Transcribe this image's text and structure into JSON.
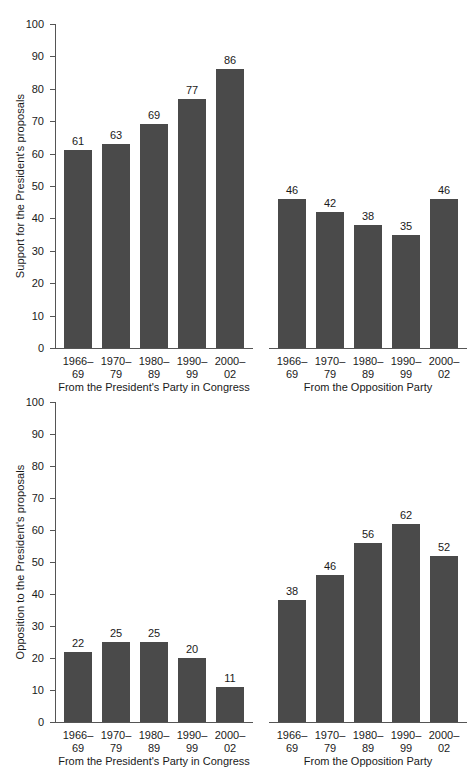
{
  "chart_data": [
    {
      "type": "bar",
      "title": "",
      "xlabel": "",
      "ylabel": "Support for the President's proposals",
      "ylim": [
        0,
        100
      ],
      "yticks": [
        0,
        10,
        20,
        30,
        40,
        50,
        60,
        70,
        80,
        90,
        100
      ],
      "grid": false,
      "legend": "none",
      "bar_color": "#4a4a4a",
      "categories": [
        "1966–\n69",
        "1970–\n79",
        "1980–\n89",
        "1990–\n99",
        "2000–\n02"
      ],
      "groups": [
        {
          "caption": "From the President's Party in Congress",
          "categories": [
            "1966–",
            "1970–",
            "1980–",
            "1990–",
            "2000–"
          ],
          "categories_line2": [
            "69",
            "79",
            "89",
            "99",
            "02"
          ],
          "values": [
            61,
            63,
            69,
            77,
            86
          ]
        },
        {
          "caption": "From the Opposition Party",
          "categories": [
            "1966–",
            "1970–",
            "1980–",
            "1990–",
            "2000–"
          ],
          "categories_line2": [
            "69",
            "79",
            "89",
            "99",
            "02"
          ],
          "values": [
            46,
            42,
            38,
            35,
            46
          ]
        }
      ]
    },
    {
      "type": "bar",
      "title": "",
      "xlabel": "",
      "ylabel": "Opposition to the President's proposals",
      "ylim": [
        0,
        100
      ],
      "yticks": [
        0,
        10,
        20,
        30,
        40,
        50,
        60,
        70,
        80,
        90,
        100
      ],
      "grid": false,
      "legend": "none",
      "bar_color": "#4a4a4a",
      "categories": [
        "1966–\n69",
        "1970–\n79",
        "1980–\n89",
        "1990–\n99",
        "2000–\n02"
      ],
      "groups": [
        {
          "caption": "From the President's Party in Congress",
          "categories": [
            "1966–",
            "1970–",
            "1980–",
            "1990–",
            "2000–"
          ],
          "categories_line2": [
            "69",
            "79",
            "89",
            "99",
            "02"
          ],
          "values": [
            22,
            25,
            25,
            20,
            11
          ]
        },
        {
          "caption": "From the Opposition Party",
          "categories": [
            "1966–",
            "1970–",
            "1980–",
            "1990–",
            "2000–"
          ],
          "categories_line2": [
            "69",
            "79",
            "89",
            "99",
            "02"
          ],
          "values": [
            38,
            46,
            56,
            62,
            52
          ]
        }
      ]
    }
  ]
}
